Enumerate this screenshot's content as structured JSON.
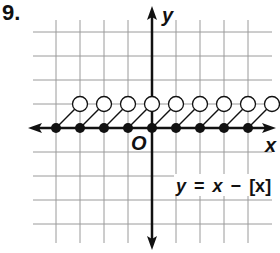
{
  "problem": {
    "number": "9."
  },
  "chart_data": {
    "type": "line",
    "title": "",
    "function": "y = x − [x]",
    "equation_label": {
      "y": "y",
      "eq": "=",
      "x": "x",
      "minus": "−",
      "bracket": "[x]"
    },
    "xlabel": "x",
    "ylabel": "y",
    "origin_label": "O",
    "xlim": [
      -5,
      5
    ],
    "ylim": [
      -5,
      4
    ],
    "grid": true,
    "segments": [
      {
        "from": [
          -4,
          0
        ],
        "to": [
          -3,
          1
        ]
      },
      {
        "from": [
          -3,
          0
        ],
        "to": [
          -2,
          1
        ]
      },
      {
        "from": [
          -2,
          0
        ],
        "to": [
          -1,
          1
        ]
      },
      {
        "from": [
          -1,
          0
        ],
        "to": [
          0,
          1
        ]
      },
      {
        "from": [
          0,
          0
        ],
        "to": [
          1,
          1
        ]
      },
      {
        "from": [
          1,
          0
        ],
        "to": [
          2,
          1
        ]
      },
      {
        "from": [
          2,
          0
        ],
        "to": [
          3,
          1
        ]
      },
      {
        "from": [
          3,
          0
        ],
        "to": [
          4,
          1
        ]
      },
      {
        "from": [
          4,
          0
        ],
        "to": [
          5,
          1
        ]
      }
    ],
    "closed_points": [
      [
        -4,
        0
      ],
      [
        -3,
        0
      ],
      [
        -2,
        0
      ],
      [
        -1,
        0
      ],
      [
        0,
        0
      ],
      [
        1,
        0
      ],
      [
        2,
        0
      ],
      [
        3,
        0
      ],
      [
        4,
        0
      ]
    ],
    "open_points": [
      [
        -3,
        1
      ],
      [
        -2,
        1
      ],
      [
        -1,
        1
      ],
      [
        0,
        1
      ],
      [
        1,
        1
      ],
      [
        2,
        1
      ],
      [
        3,
        1
      ],
      [
        4,
        1
      ],
      [
        5,
        1
      ]
    ]
  },
  "layout": {
    "origin_px": [
      152,
      128
    ],
    "unit_px": 24,
    "grid_x_lines": [
      -4,
      -3,
      -2,
      -1,
      1,
      2,
      3,
      4
    ],
    "grid_y_lines": [
      4,
      3,
      2,
      1,
      -1,
      -2,
      -3,
      -4
    ],
    "grid_left_px": 33,
    "grid_right_px": 272,
    "grid_top_px": 20,
    "grid_bottom_px": 243,
    "colors": {
      "grid": "#9a9a9a",
      "axis": "#111111",
      "ink": "#111111"
    }
  }
}
